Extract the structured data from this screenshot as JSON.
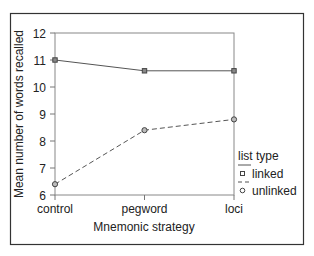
{
  "chart_data": {
    "type": "line",
    "title": "",
    "xlabel": "Mnemonic strategy",
    "ylabel": "Mean number of words recalled",
    "categories": [
      "control",
      "pegword",
      "loci"
    ],
    "series": [
      {
        "name": "linked",
        "values": [
          11.0,
          10.6,
          10.6
        ],
        "line_style": "solid",
        "marker": "square"
      },
      {
        "name": "unlinked",
        "values": [
          6.4,
          8.4,
          8.8
        ],
        "line_style": "dashed",
        "marker": "circle"
      }
    ],
    "ylim": [
      6,
      12
    ],
    "yticks": [
      6,
      7,
      8,
      9,
      10,
      11,
      12
    ],
    "grid": false,
    "legend": {
      "title": "list type",
      "position": "right",
      "entries": [
        "linked",
        "unlinked"
      ]
    }
  },
  "colors": {
    "frame": "#333333",
    "axis": "#777777",
    "line": "#555555",
    "text": "#222222"
  }
}
